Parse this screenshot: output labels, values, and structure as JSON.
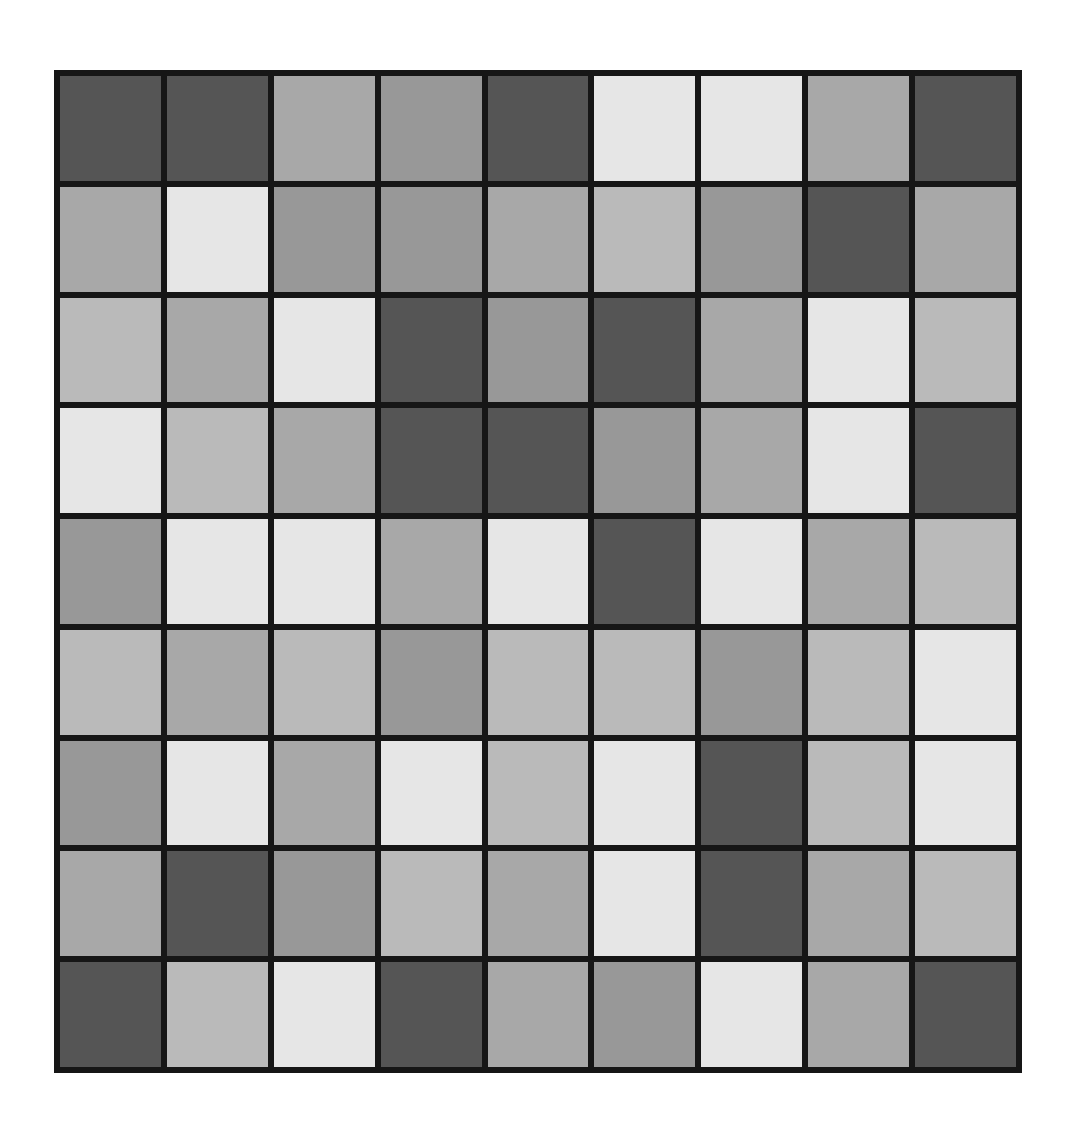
{
  "palette": {
    "D": "#555555",
    "M": "#989898",
    "LM": "#a8a8a8",
    "L": "#bababa",
    "W": "#e6e6e6",
    "grid_line": "#161616",
    "background": "#ffffff"
  },
  "grid": {
    "rows": 9,
    "cols": 9,
    "cells": [
      [
        "D",
        "D",
        "LM",
        "M",
        "D",
        "W",
        "W",
        "LM",
        "D"
      ],
      [
        "LM",
        "W",
        "M",
        "M",
        "LM",
        "L",
        "M",
        "D",
        "LM"
      ],
      [
        "L",
        "LM",
        "W",
        "D",
        "M",
        "D",
        "LM",
        "W",
        "L"
      ],
      [
        "W",
        "L",
        "LM",
        "D",
        "D",
        "M",
        "LM",
        "W",
        "D"
      ],
      [
        "M",
        "W",
        "W",
        "LM",
        "W",
        "D",
        "W",
        "LM",
        "L"
      ],
      [
        "L",
        "LM",
        "L",
        "M",
        "L",
        "L",
        "M",
        "L",
        "W"
      ],
      [
        "M",
        "W",
        "LM",
        "W",
        "L",
        "W",
        "D",
        "L",
        "W"
      ],
      [
        "LM",
        "D",
        "M",
        "L",
        "LM",
        "W",
        "D",
        "LM",
        "L"
      ],
      [
        "D",
        "L",
        "W",
        "D",
        "LM",
        "M",
        "W",
        "LM",
        "D"
      ]
    ]
  }
}
